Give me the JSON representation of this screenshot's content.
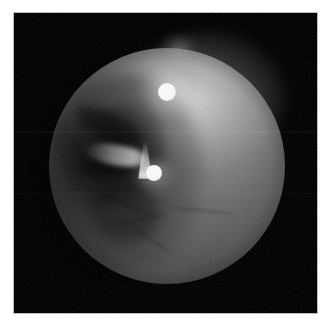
{
  "figure": {
    "kind": "endoscopic-photograph",
    "caption": "",
    "frame": {
      "mat_color": "#ffffff",
      "border_color": "#bdbdbd",
      "background_color": "#000000"
    }
  },
  "scene": {
    "description": "Endoscopic view of a pale rounded tissue mass filling the circular field of view, with two bright specular light reflections and a shadowed textured recess on the left.",
    "field_of_view": {
      "shape": "circle",
      "center_x": 153,
      "center_y": 153,
      "radius": 118,
      "background_color": "#020202",
      "tissue_color": "#6e6e6e",
      "highlight_color": "#ffffff"
    },
    "regions": [
      {
        "name": "bright-upper-right-lobe",
        "label": "Illuminated tissue dome",
        "brightness": "bright",
        "color": "#b4b4b4"
      },
      {
        "name": "dark-left-recess",
        "label": "Shadowed textured recess",
        "brightness": "dark",
        "color": "#1f1f1f"
      },
      {
        "name": "lower-tissue-field",
        "label": "Lower tissue field with faint vessels",
        "brightness": "mid",
        "color": "#6a6a6a"
      }
    ],
    "specular_highlights": [
      {
        "name": "specular-upper",
        "label": "Upper light reflection",
        "center_x": 153,
        "center_y": 79,
        "radius": 9,
        "color": "#ffffff"
      },
      {
        "name": "specular-lower",
        "label": "Lower light reflection",
        "center_x": 140,
        "center_y": 160,
        "radius": 8,
        "color": "#ffffff"
      }
    ],
    "features": [
      {
        "name": "tissue-flap",
        "label": "Pale tissue flap",
        "color": "#d8d8d8"
      },
      {
        "name": "flap-tail",
        "label": "Bright tapered plume above lower reflection",
        "color": "#f2f2f2"
      }
    ]
  }
}
